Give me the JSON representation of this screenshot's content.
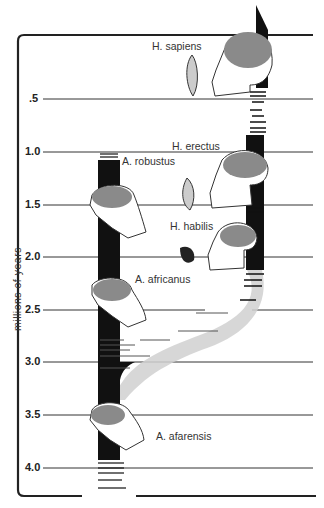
{
  "diagram": {
    "axis_title": "millions  of  years",
    "ticks": [
      {
        "label": ".5",
        "value": 0.5,
        "y": 99
      },
      {
        "label": "1.0",
        "value": 1.0,
        "y": 152
      },
      {
        "label": "1.5",
        "value": 1.5,
        "y": 205
      },
      {
        "label": "2.0",
        "value": 2.0,
        "y": 257
      },
      {
        "label": "2.5",
        "value": 2.5,
        "y": 310
      },
      {
        "label": "3.0",
        "value": 3.0,
        "y": 362
      },
      {
        "label": "3.5",
        "value": 3.5,
        "y": 415
      },
      {
        "label": "4.0",
        "value": 4.0,
        "y": 468
      }
    ],
    "species": [
      {
        "name": "H.  sapiens",
        "lineage": "Homo"
      },
      {
        "name": "H. erectus",
        "lineage": "Homo"
      },
      {
        "name": "H. habilis",
        "lineage": "Homo"
      },
      {
        "name": "A. robustus",
        "lineage": "Australopithecus"
      },
      {
        "name": "A. africanus",
        "lineage": "Australopithecus"
      },
      {
        "name": "A. afarensis",
        "lineage": "Australopithecus"
      }
    ],
    "colors": {
      "line": "#222222",
      "bar": "#111111",
      "braincase": "#8a8a8a",
      "transition": "#d0d0d0"
    }
  }
}
